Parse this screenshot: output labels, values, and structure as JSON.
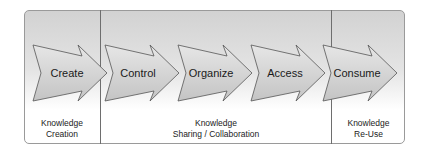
{
  "diagram": {
    "type": "process-flow",
    "steps": [
      {
        "label": "Create"
      },
      {
        "label": "Control"
      },
      {
        "label": "Organize"
      },
      {
        "label": "Access"
      },
      {
        "label": "Consume"
      }
    ],
    "phases": [
      {
        "line1": "Knowledge",
        "line2": "Creation"
      },
      {
        "line1": "Knowledge",
        "line2": "Sharing / Collaboration"
      },
      {
        "line1": "Knowledge",
        "line2": "Re-Use"
      }
    ]
  }
}
